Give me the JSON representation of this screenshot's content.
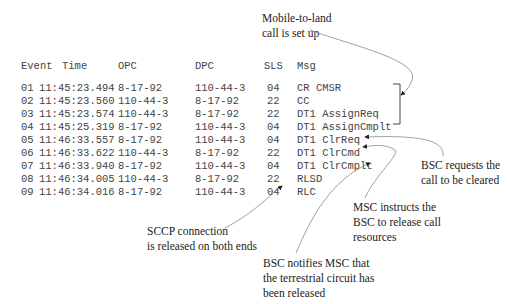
{
  "table": {
    "headers": {
      "event": "Event",
      "time": "Time",
      "opc": "OPC",
      "dpc": "DPC",
      "sls": "SLS",
      "msg": "Msg"
    },
    "rows": [
      {
        "event": "01",
        "time": "11:45:23.494",
        "opc": "8-17-92",
        "dpc": "110-44-3",
        "sls": "04",
        "msg": "CR CMSR"
      },
      {
        "event": "02",
        "time": "11:45:23.560",
        "opc": "110-44-3",
        "dpc": "8-17-92",
        "sls": "22",
        "msg": "CC"
      },
      {
        "event": "03",
        "time": "11:45:23.574",
        "opc": "110-44-3",
        "dpc": "8-17-92",
        "sls": "22",
        "msg": "DT1 AssignReq"
      },
      {
        "event": "04",
        "time": "11:45:25.319",
        "opc": "8-17-92",
        "dpc": "110-44-3",
        "sls": "04",
        "msg": "DT1 AssignCmplt"
      },
      {
        "event": "05",
        "time": "11:46:33.557",
        "opc": "8-17-92",
        "dpc": "110-44-3",
        "sls": "04",
        "msg": "DT1 ClrReq"
      },
      {
        "event": "06",
        "time": "11:46:33.622",
        "opc": "110-44-3",
        "dpc": "8-17-92",
        "sls": "22",
        "msg": "DT1 ClrCmd"
      },
      {
        "event": "07",
        "time": "11:46:33.940",
        "opc": "8-17-92",
        "dpc": "110-44-3",
        "sls": "04",
        "msg": "DT1 ClrCmplt"
      },
      {
        "event": "08",
        "time": "11:46:34.005",
        "opc": "110-44-3",
        "dpc": "8-17-92",
        "sls": "22",
        "msg": "RLSD"
      },
      {
        "event": "09",
        "time": "11:46:34.016",
        "opc": "8-17-92",
        "dpc": "110-44-3",
        "sls": "04",
        "msg": "RLC"
      }
    ]
  },
  "annotations": {
    "call_setup": [
      "Mobile-to-land",
      "call is set up"
    ],
    "bsc_requests": [
      "BSC requests the",
      "call to be cleared"
    ],
    "msc_instructs": [
      "MSC instructs the",
      "BSC to release call",
      "resources"
    ],
    "sccp_released": [
      "SCCP connection",
      "is released on both ends"
    ],
    "bsc_notifies": [
      "BSC notifies MSC that",
      "the terrestrial circuit has",
      "been released"
    ]
  }
}
